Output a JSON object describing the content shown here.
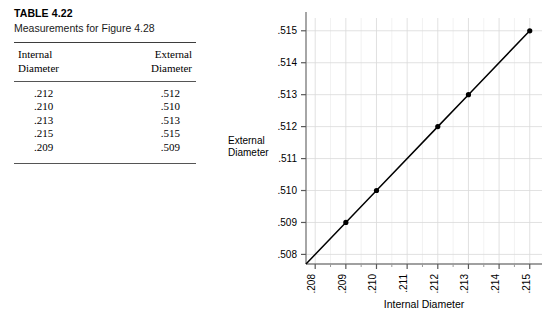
{
  "table": {
    "title": "TABLE 4.22",
    "subtitle": "Measurements for Figure 4.28",
    "columns": [
      "Internal\nDiameter",
      "External\nDiameter"
    ],
    "col1_line1": "Internal",
    "col1_line2": "Diameter",
    "col2_line1": "External",
    "col2_line2": "Diameter",
    "rows": [
      {
        "internal": ".212",
        "external": ".512"
      },
      {
        "internal": ".210",
        "external": ".510"
      },
      {
        "internal": ".213",
        "external": ".513"
      },
      {
        "internal": ".215",
        "external": ".515"
      },
      {
        "internal": ".209",
        "external": ".509"
      }
    ]
  },
  "chart_data": {
    "type": "line",
    "title": "",
    "xlabel": "Internal Diameter",
    "ylabel": "External Diameter",
    "ylabel_line1": "External",
    "ylabel_line2": "Diameter",
    "x": [
      0.209,
      0.21,
      0.212,
      0.213,
      0.215
    ],
    "y": [
      0.509,
      0.51,
      0.512,
      0.513,
      0.515
    ],
    "points": [
      {
        "x": ".209",
        "y": ".509"
      },
      {
        "x": ".210",
        "y": ".510"
      },
      {
        "x": ".212",
        "y": ".512"
      },
      {
        "x": ".213",
        "y": ".513"
      },
      {
        "x": ".215",
        "y": ".515"
      }
    ],
    "xlim": [
      0.2077,
      0.2154
    ],
    "ylim": [
      0.5077,
      0.5154
    ],
    "xticks": [
      ".208",
      ".209",
      ".210",
      ".211",
      ".212",
      ".213",
      ".214",
      ".215"
    ],
    "xtick_values": [
      0.208,
      0.209,
      0.21,
      0.211,
      0.212,
      0.213,
      0.214,
      0.215
    ],
    "yticks": [
      ".508",
      ".509",
      ".510",
      ".511",
      ".512",
      ".513",
      ".514",
      ".515"
    ],
    "ytick_values": [
      0.508,
      0.509,
      0.51,
      0.511,
      0.512,
      0.513,
      0.514,
      0.515
    ],
    "grid": true,
    "legend": "none",
    "xtick_rotation": "90",
    "marker": "filled-circle",
    "line_color": "#000000",
    "grid_color": "#d9d9d9",
    "axis_color": "#808080"
  }
}
